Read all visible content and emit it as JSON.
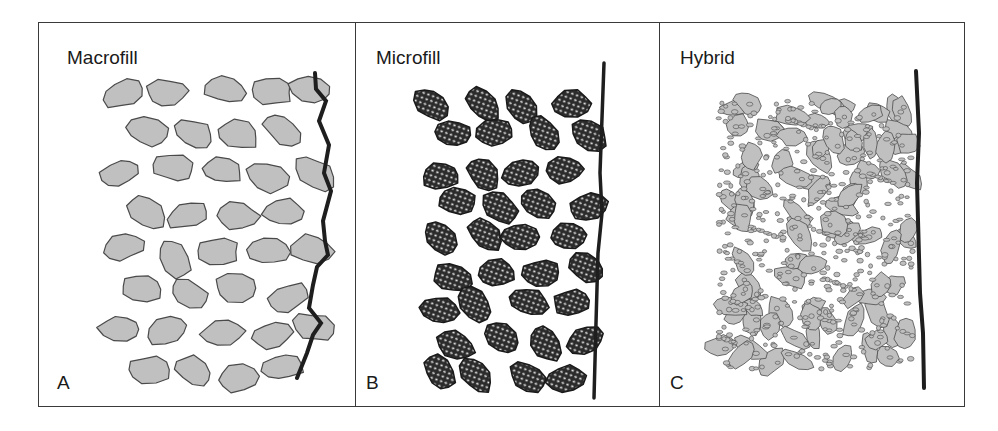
{
  "figure": {
    "panels": [
      {
        "id": "A",
        "title": "Macrofill",
        "letter": "A",
        "particle_fill": "#c0c0c0",
        "particle_stroke": "#4a4a4a",
        "description": "large irregular filler particles with rough surface line"
      },
      {
        "id": "B",
        "title": "Microfill",
        "letter": "B",
        "particle_fill": "#2b2b2b",
        "particle_stroke": "#1a1a1a",
        "description": "prepolymerized clusters containing microfiller dots, smooth surface line"
      },
      {
        "id": "C",
        "title": "Hybrid",
        "letter": "C",
        "particle_fill": "#c0c0c0",
        "particle_stroke": "#4a4a4a",
        "description": "mixed large particles and small particles, smooth surface line"
      }
    ],
    "colors": {
      "frame": "#3a3a3a",
      "surface_line": "#1e1e1e",
      "background": "#ffffff"
    }
  }
}
